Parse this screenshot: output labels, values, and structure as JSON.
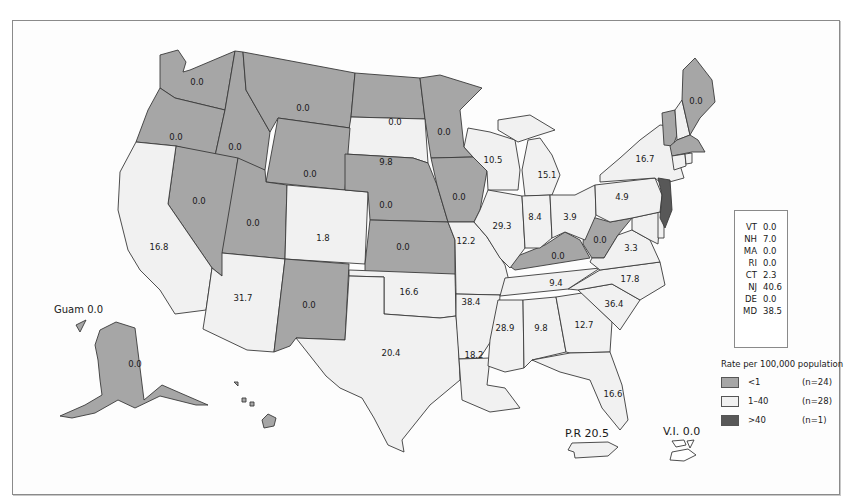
{
  "map": {
    "legend": {
      "title": "Rate per 100,000 population",
      "items": [
        {
          "range": "<1",
          "count": "(n=24)",
          "color": "#a6a6a6"
        },
        {
          "range": "1–40",
          "count": "(n=28)",
          "color": "#f1f1f1"
        },
        {
          "range": ">40",
          "count": "(n=1)",
          "color": "#585858"
        }
      ]
    },
    "northeast_table": [
      {
        "state": "VT",
        "value": "0.0"
      },
      {
        "state": "NH",
        "value": "7.0"
      },
      {
        "state": "MA",
        "value": "0.0"
      },
      {
        "state": "RI",
        "value": "0.0"
      },
      {
        "state": "CT",
        "value": "2.3"
      },
      {
        "state": "NJ",
        "value": "40.6"
      },
      {
        "state": "DE",
        "value": "0.0"
      },
      {
        "state": "MD",
        "value": "38.5"
      }
    ],
    "territories": {
      "guam": "Guam 0.0",
      "pr": "P.R 20.5",
      "vi": "V.I. 0.0"
    },
    "state_values": {
      "WA": "0.0",
      "OR": "0.0",
      "ID": "0.0",
      "MT": "0.0",
      "ND": "0.0",
      "MN": "0.0",
      "SD": "9.8",
      "WY": "0.0",
      "NV": "0.0",
      "UT": "0.0",
      "CO": "1.8",
      "NE": "0.0",
      "IA": "0.0",
      "KS": "0.0",
      "CA": "16.8",
      "AZ": "31.7",
      "NM": "0.0",
      "OK": "16.6",
      "TX": "20.4",
      "MO": "12.2",
      "AR": "38.4",
      "LA": "18.2",
      "MS": "28.9",
      "AL": "9.8",
      "GA": "12.7",
      "FL": "16.6",
      "SC": "36.4",
      "NC": "17.8",
      "TN": "9.4",
      "KY": "0.0",
      "WV": "0.0",
      "VA": "3.3",
      "WI": "10.5",
      "MI": "15.1",
      "IL": "29.3",
      "IN": "8.4",
      "OH": "3.9",
      "PA": "4.9",
      "NY": "16.7",
      "ME": "0.0",
      "AK": "0.0"
    }
  }
}
